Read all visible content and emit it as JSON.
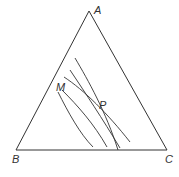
{
  "diagram": {
    "type": "ternary-diagram",
    "vertices": [
      {
        "label": "A",
        "x": 89,
        "y": 11,
        "label_x": 94,
        "label_y": 14
      },
      {
        "label": "B",
        "x": 16,
        "y": 150,
        "label_x": 12,
        "label_y": 163
      },
      {
        "label": "C",
        "x": 167,
        "y": 150,
        "label_x": 165,
        "label_y": 163
      }
    ],
    "points": [
      {
        "label": "M",
        "label_x": 56,
        "label_y": 91
      },
      {
        "label": "P",
        "label_x": 99,
        "label_y": 109
      }
    ],
    "curves": [
      {
        "d": "M58,92 C68,112 80,134 93,147"
      },
      {
        "d": "M62,90 C78,106 94,124 107,147"
      },
      {
        "d": "M64,77 C84,90 108,114 130,142"
      },
      {
        "d": "M70,70 C86,94 102,118 120,148"
      },
      {
        "d": "M75,58 C88,80 106,112 118,150"
      }
    ],
    "colors": {
      "line": "#333333",
      "background": "#ffffff"
    }
  }
}
